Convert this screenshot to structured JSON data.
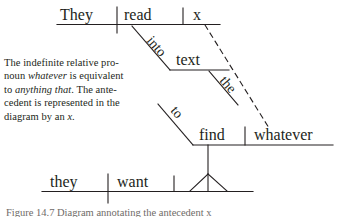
{
  "figure": {
    "type": "sentence-diagram",
    "sentence": "They read x into text to find whatever they want.",
    "note_lines": [
      {
        "pre": "The indefinite relative pro-",
        "italic": "",
        "post": ""
      },
      {
        "pre": "noun ",
        "italic": "whatever",
        "post": " is equivalent"
      },
      {
        "pre": "to ",
        "italic": "anything that",
        "post": ". The ante-"
      },
      {
        "pre": "cedent is represented in the",
        "italic": "",
        "post": ""
      },
      {
        "pre": "diagram by an ",
        "italic": "x",
        "post": "."
      }
    ],
    "caption": "Figure 14.7  Diagram annotating the antecedent x",
    "ink_color": "#231f20",
    "labels": {
      "subject_main": "They",
      "verb_main": "read",
      "object_main": "x",
      "prep_into": "into",
      "prep_object_text": "text",
      "article_the": "the",
      "infinitive_to": "to",
      "verb_find": "find",
      "object_whatever": "whatever",
      "subject_lower": "they",
      "verb_lower": "want"
    },
    "connector": {
      "kind": "dashed",
      "from": "x",
      "to": "whatever",
      "meaning": "antecedent link"
    }
  }
}
